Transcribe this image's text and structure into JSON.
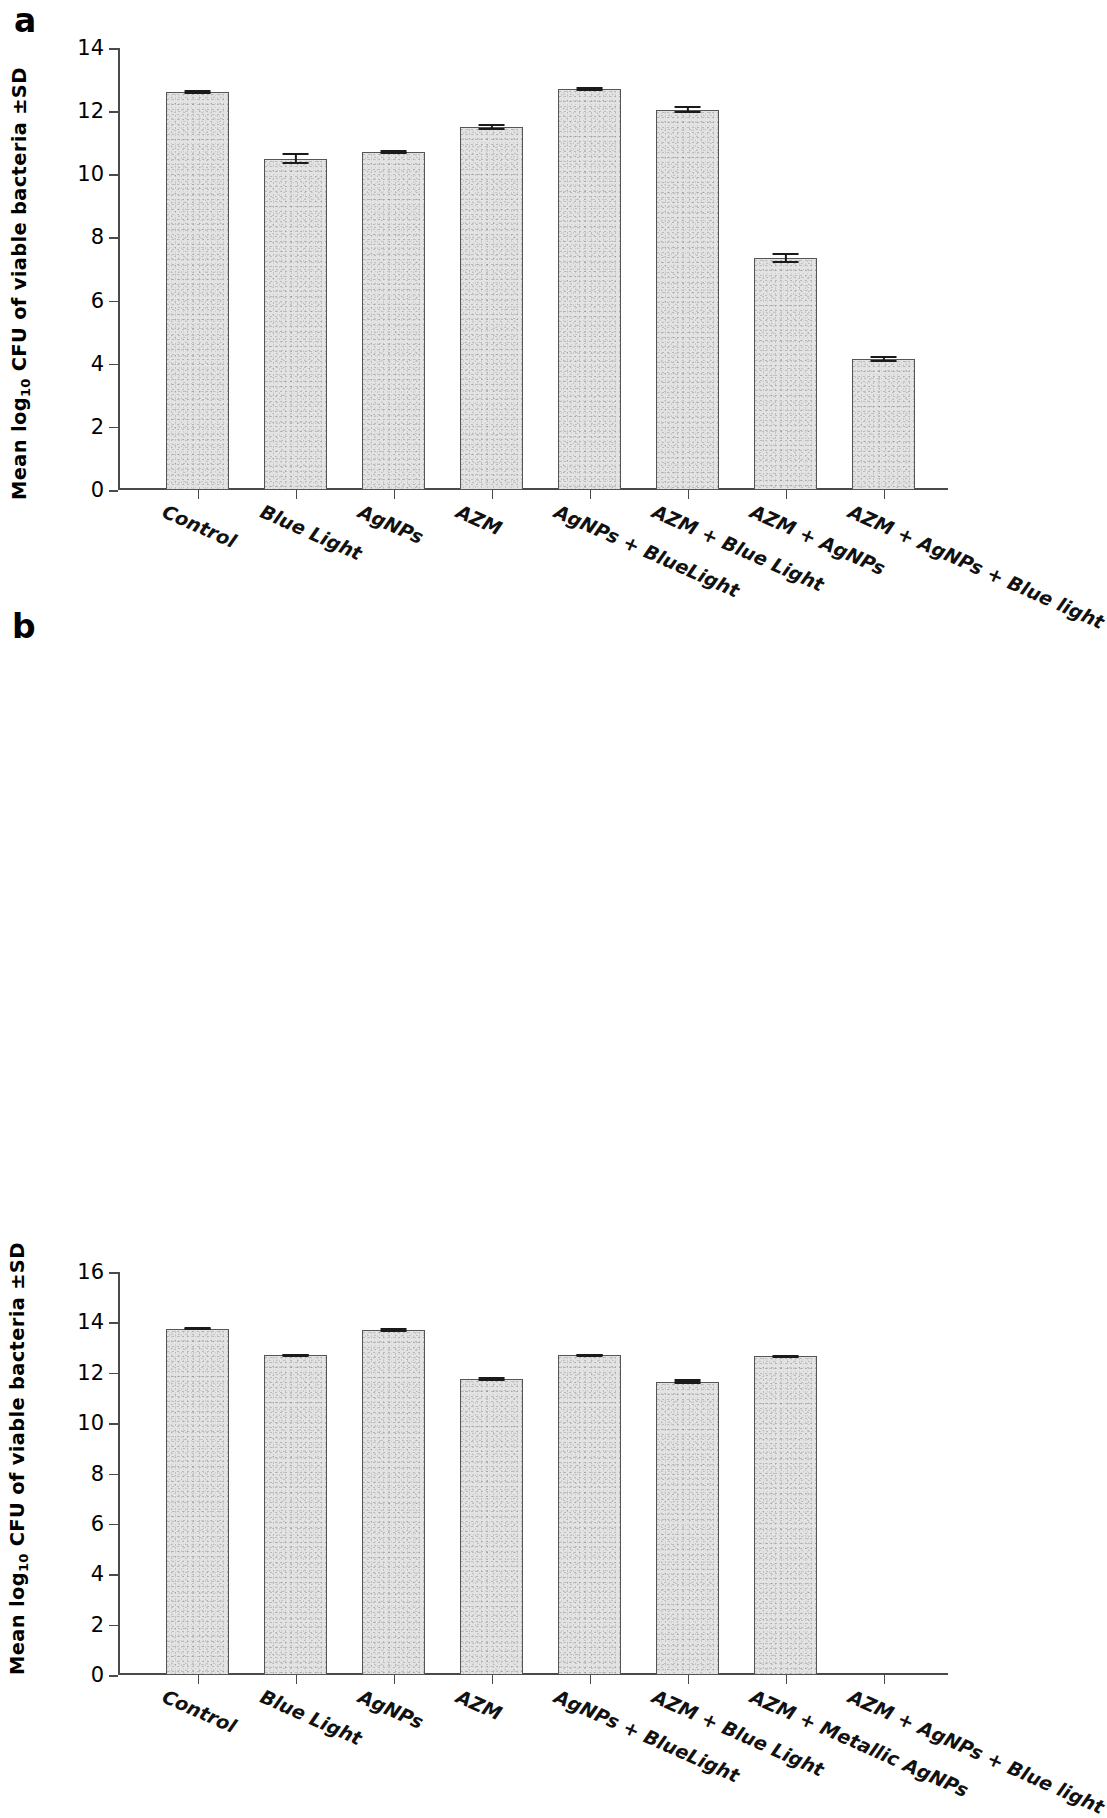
{
  "figure": {
    "panels": [
      {
        "letter": "a",
        "ylabel_prefix": "Mean log",
        "ylabel_sub": "10",
        "ylabel_suffix": " CFU of viable bacteria ±SD"
      },
      {
        "letter": "b",
        "ylabel_prefix": "Mean log",
        "ylabel_sub": "10",
        "ylabel_suffix": " CFU of viable bacteria ±SD"
      }
    ]
  },
  "chart_data": [
    {
      "type": "bar",
      "panel": "a",
      "title": "",
      "xlabel": "",
      "ylabel": "Mean log10 CFU of viable bacteria ±SD",
      "ylim": [
        0,
        14
      ],
      "yticks": [
        0,
        2,
        4,
        6,
        8,
        10,
        12,
        14
      ],
      "ytick_labels": [
        "0",
        "2",
        "4",
        "6",
        "8",
        "10",
        "12",
        "14"
      ],
      "grid": false,
      "legend": "none",
      "categories": [
        "Control",
        "Blue Light",
        "AgNPs",
        "AZM",
        "AgNPs + BlueLight",
        "AZM + Blue Light",
        "AZM + AgNPs",
        "AZM + AgNPs + Blue light"
      ],
      "values": [
        12.6,
        10.5,
        10.7,
        11.5,
        12.7,
        12.05,
        7.35,
        4.15
      ],
      "errors": [
        0.07,
        0.17,
        0.06,
        0.1,
        0.07,
        0.11,
        0.17,
        0.09
      ]
    },
    {
      "type": "bar",
      "panel": "b",
      "title": "",
      "xlabel": "",
      "ylabel": "Mean log10 CFU of viable bacteria ±SD",
      "ylim": [
        0,
        16
      ],
      "yticks": [
        0,
        2,
        4,
        6,
        8,
        10,
        12,
        14,
        16
      ],
      "ytick_labels": [
        "0",
        "2",
        "4",
        "6",
        "8",
        "10",
        "12",
        "14",
        "16"
      ],
      "grid": false,
      "legend": "none",
      "categories": [
        "Control",
        "Blue Light",
        "AgNPs",
        "AZM",
        "AgNPs + BlueLight",
        "AZM + Blue Light",
        "AZM + Metallic AgNPs",
        "AZM + AgNPs + Blue light"
      ],
      "values": [
        13.75,
        12.7,
        13.7,
        11.75,
        12.7,
        11.65,
        12.65,
        0
      ],
      "errors": [
        0.07,
        0.06,
        0.08,
        0.08,
        0.06,
        0.09,
        0.06,
        0
      ]
    }
  ],
  "style": {
    "bar_fill": "#e3e3e3",
    "bar_border": "#555555",
    "axis_color": "#4a4a4a",
    "error_color": "#1a1a1a",
    "background": "#ffffff"
  }
}
